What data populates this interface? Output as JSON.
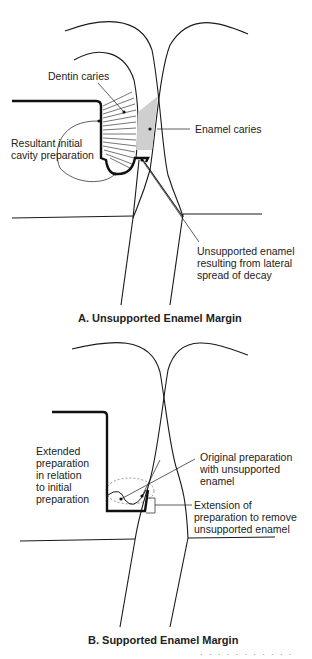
{
  "panel_a": {
    "labels": {
      "dentin_caries": "Dentin caries",
      "resultant_prep": "Resultant initial\ncavity preparation",
      "enamel_caries": "Enamel caries",
      "unsupported_enamel": "Unsupported enamel\nresulting from lateral\nspread of decay"
    },
    "caption": "A. Unsupported Enamel Margin",
    "colors": {
      "enamel_caries_fill": "#cfcfcf",
      "outline": "#1a1a1a"
    }
  },
  "panel_b": {
    "labels": {
      "extended_prep": "Extended\npreparation\nin relation\nto initial\npreparation",
      "original_prep": "Original preparation\nwith unsupported\nenamel",
      "extension": "Extension of\npreparation to remove\nunsupported enamel"
    },
    "caption": "B. Supported Enamel Margin"
  },
  "footer": {
    "fragment": "· · ·  ·  · · ·  ·  · · ·"
  }
}
